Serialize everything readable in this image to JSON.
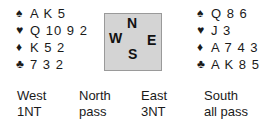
{
  "west": {
    "holdings": [
      {
        "suit": "spades",
        "symbol": "♠",
        "cards": "A K 5"
      },
      {
        "suit": "hearts",
        "symbol": "♥",
        "cards": "Q 10 9 2"
      },
      {
        "suit": "diamonds",
        "symbol": "♦",
        "cards": "K 5 2"
      },
      {
        "suit": "clubs",
        "symbol": "♣",
        "cards": "7 3 2"
      }
    ]
  },
  "east": {
    "holdings": [
      {
        "suit": "spades",
        "symbol": "♠",
        "cards": "Q 8 6"
      },
      {
        "suit": "hearts",
        "symbol": "♥",
        "cards": "J 3"
      },
      {
        "suit": "diamonds",
        "symbol": "♦",
        "cards": "A 7 4 3"
      },
      {
        "suit": "clubs",
        "symbol": "♣",
        "cards": "A K 8 5"
      }
    ]
  },
  "compass": {
    "north": "N",
    "west": "W",
    "east": "E",
    "south": "S"
  },
  "auction": {
    "headers": [
      "West",
      "North",
      "East",
      "South"
    ],
    "bids": [
      "1NT",
      "pass",
      "3NT",
      "all pass"
    ]
  }
}
